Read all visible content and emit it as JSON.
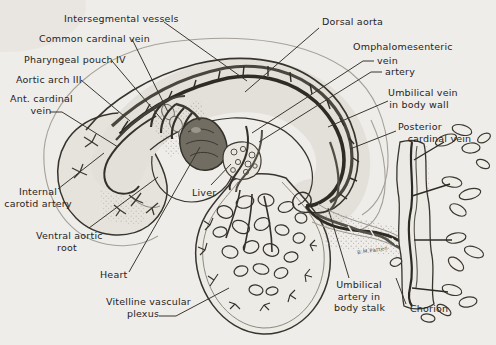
{
  "figure": {
    "kind": "embryo vascular system line drawing",
    "colors": {
      "paper": "#efede9",
      "ink": "#33302a",
      "body_wash": "#e3e0da",
      "vessel_dark": "#2e2b25",
      "vessel_mid": "#55524a"
    },
    "signature": "B.M.Patten"
  },
  "labels": {
    "intersegmental": "Intersegmental vessels",
    "common_cardinal": "Common cardinal vein",
    "pharyngeal_pouch": "Pharyngeal pouch IV",
    "aortic_arch": "Aortic arch III",
    "ant_cardinal": "Ant. cardinal\nvein",
    "internal_carotid": "Internal\ncarotid artery",
    "ventral_aortic_root": "Ventral aortic\nroot",
    "heart": "Heart",
    "vitelline_plexus": "Vitelline vascular\nplexus",
    "dorsal_aorta": "Dorsal aorta",
    "omphalomesenteric": "Omphalomesenteric",
    "omphalomesenteric_vein": "vein",
    "omphalomesenteric_artery": "artery",
    "umbilical_vein": "Umbilical vein\nin body wall",
    "posterior_cardinal": "Posterior\n   cardinal vein",
    "liver": "Liver",
    "umbilical_artery": "Umbilical\nartery in\nbody stalk",
    "chorion": "Chorion"
  }
}
